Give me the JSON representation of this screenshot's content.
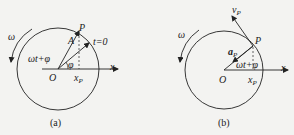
{
  "figures": [
    {
      "id": "a",
      "caption": "(a)",
      "labels": {
        "omega": "ω",
        "phase": "ωt+φ",
        "point": "P",
        "amplitude": "A",
        "initial": "t=0",
        "phi": "φ",
        "origin": "O",
        "projection": "x",
        "projection_sub": "P",
        "axis": "x"
      }
    },
    {
      "id": "b",
      "caption": "(b)",
      "labels": {
        "omega": "ω",
        "velocity": "v",
        "velocity_sub": "P",
        "acceleration": "a",
        "acceleration_sub": "P",
        "point": "P",
        "phase": "ωt+φ",
        "origin": "O",
        "projection": "x",
        "projection_sub": "P",
        "axis": "x"
      }
    }
  ],
  "colors": {
    "stroke": "#222222",
    "background": "#f3f3f1"
  }
}
